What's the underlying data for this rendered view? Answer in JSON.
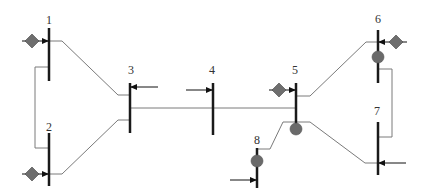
{
  "diagram": {
    "type": "single-line power system diagram",
    "buses": [
      {
        "id": "1",
        "label": "1"
      },
      {
        "id": "2",
        "label": "2"
      },
      {
        "id": "3",
        "label": "3"
      },
      {
        "id": "4",
        "label": "4"
      },
      {
        "id": "5",
        "label": "5"
      },
      {
        "id": "6",
        "label": "6"
      },
      {
        "id": "7",
        "label": "7"
      },
      {
        "id": "8",
        "label": "8"
      }
    ],
    "generators": [
      "1",
      "2",
      "5",
      "6"
    ],
    "loads": [
      "3",
      "4",
      "7",
      "8"
    ],
    "compensators": [
      "5",
      "6",
      "8"
    ],
    "lines": [
      [
        "1",
        "2"
      ],
      [
        "1",
        "3"
      ],
      [
        "2",
        "3"
      ],
      [
        "3",
        "5"
      ],
      [
        "5",
        "6"
      ],
      [
        "5",
        "7"
      ],
      [
        "5",
        "8"
      ],
      [
        "6",
        "7"
      ]
    ],
    "colors": {
      "bus": "#1a1a1a",
      "line": "#7a7a7a",
      "generator": "#6e6e6e",
      "compensator": "#6a6a6a"
    }
  }
}
